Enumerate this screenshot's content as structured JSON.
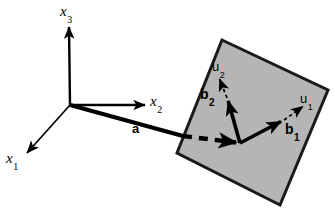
{
  "figure": {
    "background_color": "#ffffff",
    "stroke_color": "#000000",
    "plane_fill_color": "#b5b5b5",
    "plane_edge_color": "#1a1a1a"
  },
  "axes": {
    "origin": {
      "x": 70,
      "y": 105
    },
    "items": [
      {
        "id": "x3",
        "name": "x3-axis",
        "base": "x",
        "sub": "3",
        "tip": {
          "x": 69,
          "y": 25
        },
        "style": "solid",
        "width": 2.4
      },
      {
        "id": "x2",
        "name": "x2-axis",
        "base": "x",
        "sub": "2",
        "tip": {
          "x": 147,
          "y": 105
        },
        "style": "solid",
        "width": 2.4
      },
      {
        "id": "x1",
        "name": "x1-axis",
        "base": "x",
        "sub": "1",
        "tip": {
          "x": 25,
          "y": 155
        },
        "style": "solid",
        "width": 1.6
      }
    ]
  },
  "plane": {
    "name": "shaded-plane",
    "corners": [
      {
        "x": 222,
        "y": 40
      },
      {
        "x": 328,
        "y": 90
      },
      {
        "x": 280,
        "y": 205
      },
      {
        "x": 177,
        "y": 153
      }
    ],
    "fill": "#b5b5b5",
    "stroke_width": 3
  },
  "vectors": [
    {
      "id": "a",
      "name": "vector-a",
      "base": "a",
      "sub": "",
      "from": {
        "x": 70,
        "y": 105
      },
      "to": {
        "x": 182,
        "y": 136
      },
      "style": "solid",
      "width": 4,
      "arrowhead": false
    },
    {
      "id": "a_dashed",
      "name": "vector-a-dashed-continuation",
      "base": "",
      "sub": "",
      "from": {
        "x": 182,
        "y": 136
      },
      "to": {
        "x": 240,
        "y": 143
      },
      "style": "dashed",
      "width": 4,
      "arrowhead": true
    },
    {
      "id": "b2",
      "name": "vector-b2",
      "base": "b",
      "sub": "2",
      "from": {
        "x": 240,
        "y": 143
      },
      "to": {
        "x": 227,
        "y": 98
      },
      "style": "solid",
      "width": 3.4,
      "arrowhead": true
    },
    {
      "id": "u2",
      "name": "unit-vector-u2",
      "base": "u",
      "sub": "2",
      "from": {
        "x": 227,
        "y": 98
      },
      "to": {
        "x": 218,
        "y": 76
      },
      "style": "dashed",
      "width": 1.6,
      "arrowhead": true
    },
    {
      "id": "b1",
      "name": "vector-b1",
      "base": "b",
      "sub": "1",
      "from": {
        "x": 240,
        "y": 143
      },
      "to": {
        "x": 284,
        "y": 120
      },
      "style": "solid",
      "width": 3.4,
      "arrowhead": true
    },
    {
      "id": "u1",
      "name": "unit-vector-u1",
      "base": "u",
      "sub": "1",
      "from": {
        "x": 284,
        "y": 120
      },
      "to": {
        "x": 306,
        "y": 104
      },
      "style": "dashed",
      "width": 1.6,
      "arrowhead": true
    }
  ],
  "labels": {
    "x3": {
      "base": "x",
      "sub": "3"
    },
    "x2": {
      "base": "x",
      "sub": "2"
    },
    "x1": {
      "base": "x",
      "sub": "1"
    },
    "a": {
      "base": "a",
      "sub": ""
    },
    "b2": {
      "base": "b",
      "sub": "2"
    },
    "u2": {
      "base": "u",
      "sub": "2"
    },
    "b1": {
      "base": "b",
      "sub": "1"
    },
    "u1": {
      "base": "u",
      "sub": "1"
    }
  }
}
